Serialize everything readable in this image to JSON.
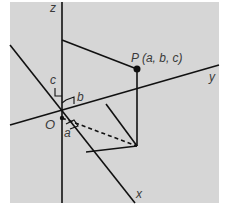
{
  "diagram": {
    "type": "3d-coordinate-system",
    "background_color": "#d6d6d6",
    "line_color": "#111111",
    "label_color": "#3a3a3a",
    "axes": {
      "x": {
        "label": "x"
      },
      "y": {
        "label": "y"
      },
      "z": {
        "label": "z"
      }
    },
    "origin": {
      "label": "O"
    },
    "point": {
      "label": "P (a, b, c)"
    },
    "components": {
      "a": "a",
      "b": "b",
      "c": "c"
    }
  }
}
